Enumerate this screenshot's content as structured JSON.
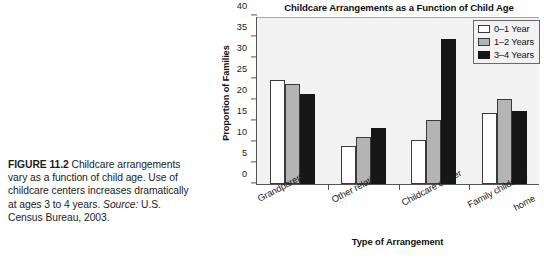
{
  "caption": {
    "figure_number": "FIGURE 11.2",
    "text": "Childcare arrangements vary as a function of child age. Use of childcare centers increases dramatically at ages 3 to 4 years.",
    "source_label": "Source:",
    "source_text": "U.S. Census Bureau, 2003."
  },
  "chart_data": {
    "type": "bar",
    "title": "Childcare Arrangements as a Function of Child Age",
    "xlabel": "Type of Arrangement",
    "ylabel": "Proportion of Families",
    "categories": [
      "Grandparent",
      "Other relative",
      "Childcare center",
      "Family childcare home"
    ],
    "series": [
      {
        "name": "0–1 Year",
        "values": [
          24.7,
          9.0,
          10.5,
          17.0
        ],
        "color": "#ffffff"
      },
      {
        "name": "1–2 Years",
        "values": [
          23.8,
          11.2,
          15.3,
          20.3
        ],
        "color": "#b4b4b4"
      },
      {
        "name": "3–4 Years",
        "values": [
          21.5,
          13.4,
          34.5,
          17.3
        ],
        "color": "#161616"
      }
    ],
    "ylim": [
      0,
      40
    ],
    "yticks": [
      0,
      5,
      10,
      15,
      20,
      25,
      30,
      35,
      40
    ],
    "grid": false,
    "legend_position": "top-right",
    "plot_background": "#f2f2f2"
  }
}
